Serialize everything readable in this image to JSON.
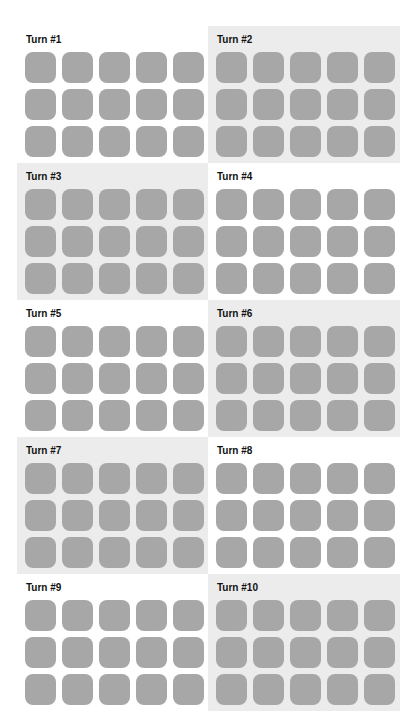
{
  "panels": [
    {
      "title": "Turn #1",
      "shaded": false
    },
    {
      "title": "Turn #2",
      "shaded": true
    },
    {
      "title": "Turn #3",
      "shaded": true
    },
    {
      "title": "Turn #4",
      "shaded": false
    },
    {
      "title": "Turn #5",
      "shaded": false
    },
    {
      "title": "Turn #6",
      "shaded": true
    },
    {
      "title": "Turn #7",
      "shaded": true
    },
    {
      "title": "Turn #8",
      "shaded": false
    },
    {
      "title": "Turn #9",
      "shaded": false
    },
    {
      "title": "Turn #10",
      "shaded": true
    }
  ],
  "grid": {
    "rows": 3,
    "cols": 5
  },
  "colors": {
    "tile": "#a7a7a7",
    "shaded_bg": "#ececec",
    "plain_bg": "#ffffff"
  }
}
